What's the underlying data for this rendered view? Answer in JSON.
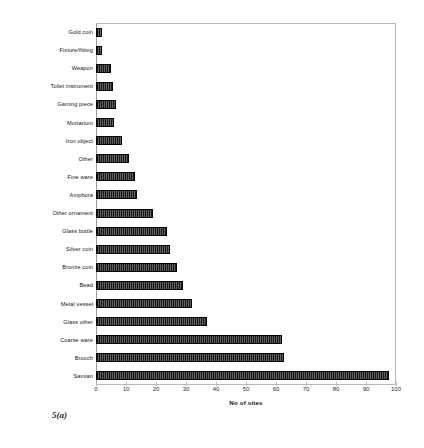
{
  "figure": {
    "caption": "5(a)"
  },
  "chart_data": {
    "type": "bar",
    "orientation": "horizontal",
    "title": "",
    "subtitle": "",
    "xlabel": "No of sites",
    "ylabel": "",
    "xlim": [
      0,
      100
    ],
    "ylim": null,
    "grid": false,
    "legend": null,
    "legend_position": "none",
    "bar_color": "#1a1a1a",
    "xticks": [
      0,
      10,
      20,
      30,
      40,
      50,
      60,
      70,
      80,
      90,
      100
    ],
    "xtick_labels": [
      "0",
      "10",
      "20",
      "30",
      "40",
      "50",
      "60",
      "70",
      "80",
      "90",
      "100"
    ],
    "categories": [
      "Gold coin",
      "Fixture/fitting",
      "Weapon",
      "Toilet instrument",
      "Gaming piece",
      "Mortarium",
      "Iron object",
      "Other",
      "Fine ware",
      "Amphora",
      "Other ornament",
      "Glass bottle",
      "Silver coin",
      "Bronze coin",
      "Bead",
      "Metal vessel",
      "Glass other",
      "Coarse ware",
      "Brooch",
      "Samian"
    ],
    "values": [
      2,
      2,
      5,
      5.5,
      6.5,
      6,
      8.5,
      11,
      13,
      13.5,
      19,
      23.5,
      24.5,
      27,
      29,
      32,
      37,
      62,
      62.5,
      97.5
    ]
  }
}
